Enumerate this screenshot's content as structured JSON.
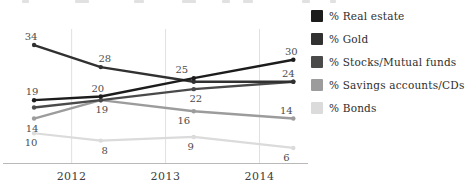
{
  "chart_data": {
    "type": "line",
    "title": "",
    "x_unit": "year",
    "x": [
      2011.6,
      2012.31,
      2013.3,
      2014.36
    ],
    "x_ticks": [
      {
        "label": "2012",
        "year": 2012
      },
      {
        "label": "2013",
        "year": 2013
      },
      {
        "label": "2014",
        "year": 2014
      }
    ],
    "xlim": [
      2011.28,
      2014.58
    ],
    "ylim": [
      0,
      40
    ],
    "grid": "vertical",
    "legend_position": "right",
    "axis_color": "#b9b9b9",
    "gridline_color": "#e0e0e0",
    "series": [
      {
        "name": "% Real estate",
        "color": "#1c1c1c",
        "stroke_width": 2.4,
        "values": [
          19,
          20,
          25,
          30
        ],
        "point_labels": [
          "19",
          "20",
          "25",
          "30"
        ],
        "label_side": [
          "above",
          "above",
          "above",
          "above"
        ],
        "label_dx": [
          -2,
          -3,
          -12,
          -2
        ]
      },
      {
        "name": "% Gold",
        "color": "#313131",
        "stroke_width": 2.4,
        "values": [
          34,
          28,
          24,
          24
        ],
        "point_labels": [
          "34",
          "28",
          null,
          "24"
        ],
        "label_side": [
          "above",
          "above",
          null,
          "above"
        ],
        "label_dx": [
          -3,
          4,
          0,
          -5
        ]
      },
      {
        "name": "% Stocks/Mutual funds",
        "color": "#4a4a4a",
        "stroke_width": 2.4,
        "values": [
          17,
          19,
          22,
          24
        ],
        "point_labels": [
          null,
          null,
          "22",
          null
        ],
        "label_side": [
          null,
          null,
          "below",
          null
        ],
        "label_dx": [
          0,
          0,
          2,
          0
        ]
      },
      {
        "name": "% Savings accounts/CDs",
        "color": "#9c9c9c",
        "stroke_width": 2.4,
        "values": [
          14,
          19,
          16,
          14
        ],
        "point_labels": [
          "14",
          "19",
          "16",
          "14"
        ],
        "label_side": [
          "below",
          "below",
          "below",
          "above"
        ],
        "label_dx": [
          -2,
          1,
          -10,
          -7
        ]
      },
      {
        "name": "% Bonds",
        "color": "#dbdbdb",
        "stroke_width": 2.2,
        "values": [
          10,
          8,
          9,
          6
        ],
        "point_labels": [
          "10",
          "8",
          "9",
          "6"
        ],
        "label_side": [
          "below",
          "below",
          "below",
          "below"
        ],
        "label_dx": [
          -3,
          4,
          -3,
          -7
        ]
      }
    ]
  }
}
